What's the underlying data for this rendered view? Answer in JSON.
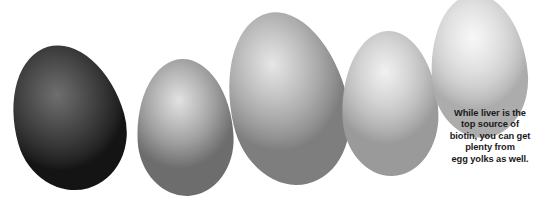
{
  "background_color": "#ffffff",
  "canvas": {
    "width": 545,
    "height": 201
  },
  "illustration": {
    "name": "row-of-eggs",
    "description": "Five eggs arranged left to right in an ascending arc, shaded from dark charcoal to near white",
    "eggs": [
      {
        "index": 1,
        "label": "egg-darkest",
        "shell_color": "#474747",
        "highlight_color": "#6e6e6e",
        "shadow_color": "#141414"
      },
      {
        "index": 2,
        "label": "egg-medium-dark",
        "shell_color": "#b6b6b6",
        "highlight_color": "#e2e2e2",
        "shadow_color": "#6d6d6d"
      },
      {
        "index": 3,
        "label": "egg-largest",
        "shell_color": "#c0c0c0",
        "highlight_color": "#e6e6e6",
        "shadow_color": "#7e7e7e"
      },
      {
        "index": 4,
        "label": "egg-light",
        "shell_color": "#d3d3d3",
        "highlight_color": "#f1f1f1",
        "shadow_color": "#9a9a9a"
      },
      {
        "index": 5,
        "label": "egg-lightest",
        "shell_color": "#e0e0e0",
        "highlight_color": "#f7f7f7",
        "shadow_color": "#acacac"
      }
    ]
  },
  "caption": {
    "text_color": "#1a1a1a",
    "full_text": "While liver is the top source of biotin, you can get plenty from egg yolks as well.",
    "lines": [
      "While liver is the",
      "top source of",
      "biotin, you can get",
      "plenty from",
      "egg yolks as well."
    ]
  }
}
